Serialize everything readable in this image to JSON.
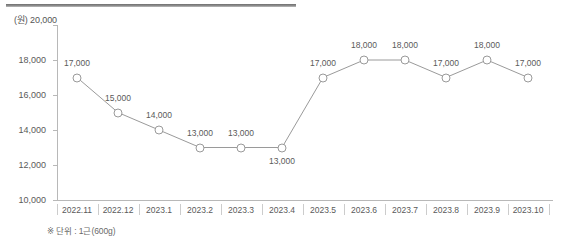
{
  "chart_data": {
    "type": "line",
    "title": "",
    "xlabel": "",
    "ylabel": "(원)",
    "unit_label": "(원) 20,000",
    "categories": [
      "2022.11",
      "2022.12",
      "2023.1",
      "2023.2",
      "2023.3",
      "2023.4",
      "2023.5",
      "2023.6",
      "2023.7",
      "2023.8",
      "2023.9",
      "2023.10"
    ],
    "values": [
      17000,
      15000,
      14000,
      13000,
      13000,
      13000,
      17000,
      18000,
      18000,
      17000,
      18000,
      17000
    ],
    "point_labels": [
      "17,000",
      "15,000",
      "14,000",
      "13,000",
      "13,000",
      "13,000",
      "17,000",
      "18,000",
      "18,000",
      "17,000",
      "18,000",
      "17,000"
    ],
    "point_label_position": [
      "above",
      "above",
      "above",
      "above",
      "above",
      "below",
      "above",
      "above",
      "above",
      "above",
      "above",
      "above"
    ],
    "ylim": [
      10000,
      20000
    ],
    "ytick_values": [
      20000,
      18000,
      16000,
      14000,
      12000,
      10000
    ],
    "ytick_labels": [
      "20,000",
      "18,000",
      "16,000",
      "14,000",
      "12,000",
      "10,000"
    ],
    "grid": false,
    "legend": "none",
    "footnote": "※ 단위 : 1근(600g)",
    "line_color": "#9a9a9a",
    "marker_fill": "#ffffff",
    "marker_stroke": "#9a9a9a",
    "axis_color": "#b8b8b8",
    "text_color": "#5a5a5a"
  }
}
